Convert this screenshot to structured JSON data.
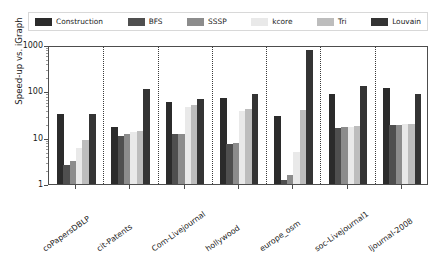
{
  "chart_data": {
    "type": "bar",
    "title": "",
    "xlabel": "",
    "ylabel": "Speed-up vs. iGraph",
    "yscale": "log",
    "ylim": [
      1,
      1000
    ],
    "yticks": [
      1,
      10,
      100,
      1000
    ],
    "ytick_labels": [
      "1",
      "10",
      "100",
      "1000"
    ],
    "grid": false,
    "legend_position": "above-plot",
    "categories": [
      "coPapersDBLP",
      "cit-Patents",
      "Com-Livejournal",
      "hollywood",
      "europe_osm",
      "soc-Livejournal1",
      "ljournal-2008"
    ],
    "series": [
      {
        "name": "Construction",
        "color": "#2b2b2b",
        "values": [
          33,
          17,
          60,
          72,
          30,
          88,
          120
        ]
      },
      {
        "name": "BFS",
        "color": "#4f4f4f",
        "values": [
          2.6,
          11,
          12,
          7.3,
          1.2,
          16,
          19
        ]
      },
      {
        "name": "SSSP",
        "color": "#8c8c8c",
        "values": [
          3.2,
          12,
          12,
          7.5,
          1.6,
          17,
          19
        ]
      },
      {
        "name": "kcore",
        "color": "#e9e9e9",
        "values": [
          6.0,
          13,
          45,
          38,
          5.0,
          17,
          20
        ]
      },
      {
        "name": "Tri",
        "color": "#bdbdbd",
        "values": [
          9.0,
          14,
          50,
          42,
          40,
          18,
          20
        ]
      },
      {
        "name": "Louvain",
        "color": "#343434",
        "values": [
          33,
          115,
          70,
          88,
          800,
          130,
          88
        ]
      }
    ]
  },
  "legend": {
    "items": [
      {
        "label": "Construction",
        "swatch": "#2b2b2b"
      },
      {
        "label": "BFS",
        "swatch": "#4f4f4f"
      },
      {
        "label": "SSSP",
        "swatch": "#8c8c8c"
      },
      {
        "label": "kcore",
        "swatch": "#e9e9e9"
      },
      {
        "label": "Tri",
        "swatch": "#bdbdbd"
      },
      {
        "label": "Louvain",
        "swatch": "#343434"
      }
    ]
  }
}
